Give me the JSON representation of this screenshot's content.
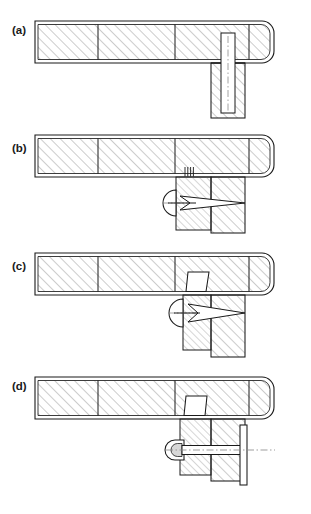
{
  "figure": {
    "background_color": "#ffffff",
    "line_color": "#1a1a1a",
    "hatch_color": "#9a9a9a",
    "centerline_color": "#8c8c8c",
    "width_px": 311,
    "height_px": 514
  },
  "panels": [
    {
      "id": "a",
      "label": "(a)",
      "label_x": 12,
      "label_y": 34,
      "caption_text": "(a)",
      "stage": "pilot-hole-prepared",
      "bar": {
        "x": 35,
        "y": 21,
        "width": 248,
        "height": 42,
        "round_right": true,
        "dividers_x": [
          98,
          175,
          249
        ]
      },
      "boss": {
        "x": 211,
        "y": 63,
        "width": 34,
        "height": 55
      },
      "hole": {
        "x": 221,
        "y": 33,
        "width": 14,
        "height": 80
      },
      "centerline": {
        "x": 228,
        "y1": 36,
        "y2": 112
      },
      "fastener": null
    },
    {
      "id": "b",
      "label": "(b)",
      "label_x": 12,
      "label_y": 152,
      "caption_text": "(b)",
      "stage": "rivet-inserted-mandrel-gripped",
      "bar": {
        "x": 35,
        "y": 135,
        "width": 248,
        "height": 42,
        "round_right": true,
        "dividers_x": [
          98,
          175,
          249
        ]
      },
      "boss": {
        "x": 211,
        "y": 177,
        "width": 34,
        "height": 56
      },
      "sleeve": {
        "x": 176,
        "y": 177,
        "width": 35,
        "height": 53
      },
      "tool_head": {
        "cx": 176,
        "cy": 203,
        "r": 13
      },
      "mandrel": {
        "x1": 163,
        "y1": 203,
        "x2": 245,
        "y2": 203
      },
      "taper": {
        "x1": 180,
        "y1": 196,
        "x2": 245,
        "y2": 203,
        "x3": 180,
        "y3": 210
      },
      "comb_marks": {
        "x": 185,
        "y": 168,
        "count": 4,
        "spacing": 2.6,
        "height": 9
      },
      "centerline": null,
      "fastener": "mandrel"
    },
    {
      "id": "c",
      "label": "(c)",
      "label_x": 12,
      "label_y": 270,
      "caption_text": "(c)",
      "stage": "mandrel-pulled-head-formed",
      "bar": {
        "x": 35,
        "y": 253,
        "width": 248,
        "height": 42,
        "round_right": true,
        "dividers_x": [
          98,
          175,
          249
        ]
      },
      "boss": {
        "x": 211,
        "y": 295,
        "width": 34,
        "height": 62
      },
      "sleeve": {
        "x": 183,
        "y": 295,
        "width": 28,
        "height": 55
      },
      "upset_head": {
        "x_top_left": 188,
        "x_top_right": 209,
        "y_top": 272,
        "x_bot_left": 186,
        "x_bot_right": 206,
        "y_bot": 295
      },
      "tool_head": {
        "cx": 183,
        "cy": 313,
        "r": 14
      },
      "mandrel": {
        "x1": 169,
        "y1": 313,
        "x2": 245,
        "y2": 313
      },
      "taper": {
        "x1": 188,
        "y1": 304,
        "x2": 245,
        "y2": 313,
        "x3": 188,
        "y3": 322
      },
      "fastener": "mandrel"
    },
    {
      "id": "d",
      "label": "(d)",
      "label_x": 12,
      "label_y": 390,
      "caption_text": "(d)",
      "stage": "installed-mandrel-broken-off",
      "bar": {
        "x": 35,
        "y": 377,
        "width": 248,
        "height": 42,
        "round_right": true,
        "dividers_x": [
          98,
          175,
          249
        ]
      },
      "boss": {
        "x": 211,
        "y": 419,
        "width": 34,
        "height": 62
      },
      "sleeve": {
        "x": 180,
        "y": 419,
        "width": 31,
        "height": 56
      },
      "upset_head": {
        "x_top_left": 186,
        "x_top_right": 207,
        "y_top": 396,
        "x_bot_left": 184,
        "x_bot_right": 205,
        "y_bot": 419
      },
      "bolt_head": {
        "x": 166,
        "y": 440,
        "width": 18,
        "height": 20,
        "radius": 9
      },
      "shank": {
        "x": 170,
        "y": 445,
        "width": 75,
        "height": 9
      },
      "flange": {
        "x": 242,
        "y": 425,
        "width": 6,
        "height": 60
      },
      "centerline": {
        "x1": 166,
        "y1": 450,
        "x2": 272,
        "y2": 450
      },
      "fastener": "installed-rivet"
    }
  ],
  "legend": {
    "hatch_description": "section hatching",
    "centerline_description": "dash-dot axis"
  }
}
